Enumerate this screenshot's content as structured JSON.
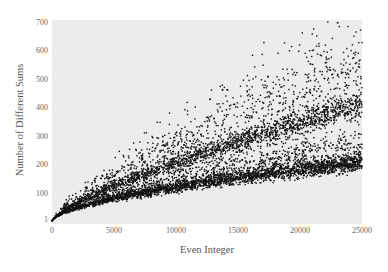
{
  "chart_data": {
    "type": "scatter",
    "title": "",
    "xlabel": "Even Integer",
    "ylabel": "Number of Different Sums",
    "xlim": [
      0,
      25000
    ],
    "ylim": [
      1,
      700
    ],
    "xticks": [
      "0",
      "5000",
      "10000",
      "15000",
      "20000",
      "25000"
    ],
    "yticks": [
      "1",
      "100",
      "200",
      "300",
      "400",
      "500",
      "600",
      "700"
    ],
    "grid": false,
    "legend": null,
    "point_color": "#111111",
    "plot_background": "#ececec",
    "series": [
      {
        "name": "bottom band",
        "approx_values": {
          "x": [
            5000,
            15000,
            25000
          ],
          "y": [
            80,
            145,
            210
          ]
        },
        "density": "very dense",
        "spread": 0.08
      },
      {
        "name": "lower-middle band",
        "approx_values": {
          "x": [
            5000,
            15000,
            25000
          ],
          "y": [
            100,
            200,
            270
          ]
        },
        "density": "medium",
        "spread": 0.12
      },
      {
        "name": "middle band",
        "approx_values": {
          "x": [
            5000,
            15000,
            25000
          ],
          "y": [
            125,
            305,
            410
          ]
        },
        "density": "dense",
        "spread": 0.07
      },
      {
        "name": "upper band",
        "approx_values": {
          "x": [
            5000,
            15000,
            25000
          ],
          "y": [
            160,
            390,
            540
          ]
        },
        "density": "medium-sparse",
        "spread": 0.12
      },
      {
        "name": "top outliers",
        "approx_values": {
          "x": [
            5000,
            15000,
            25000
          ],
          "y": [
            200,
            470,
            700
          ]
        },
        "density": "sparse",
        "spread": 0.1
      }
    ]
  },
  "axes": {
    "xlabel": "Even Integer",
    "ylabel": "Number of Different Sums",
    "yticks": [
      "700",
      "600",
      "500",
      "400",
      "300",
      "200",
      "100",
      "1"
    ],
    "xticks": [
      "0",
      "5000",
      "10000",
      "15000",
      "20000",
      "25000"
    ]
  }
}
